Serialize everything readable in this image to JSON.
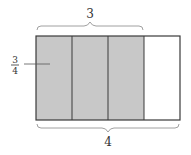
{
  "diagram": {
    "type": "fraction-area-model",
    "total_parts": 4,
    "shaded_parts": 3,
    "top_brace_label": "3",
    "bottom_brace_label": "4",
    "fraction_label": {
      "numerator": "3",
      "denominator": "4"
    },
    "colors": {
      "shaded": "#c8c8c8",
      "unshaded": "#ffffff",
      "stroke": "#3a3a3a",
      "brace": "#a0a0a0"
    }
  }
}
